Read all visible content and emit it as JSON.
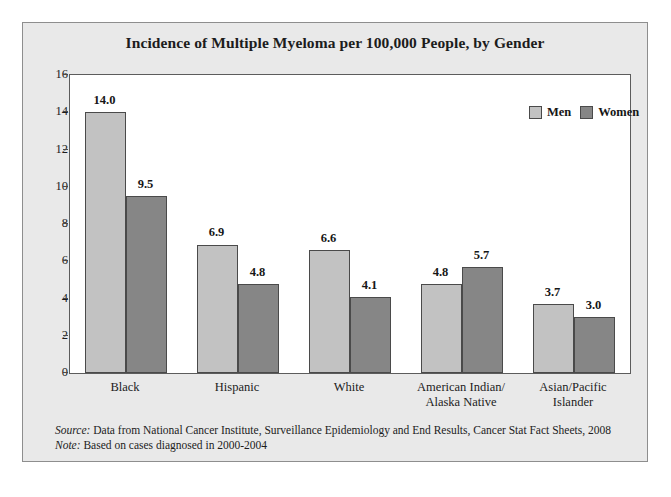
{
  "chart_data": {
    "type": "bar",
    "title": "Incidence of Multiple Myeloma per 100,000 People, by Gender",
    "xlabel": "",
    "ylabel": "",
    "ylim": [
      0,
      16
    ],
    "yticks": [
      0,
      2,
      4,
      6,
      8,
      10,
      12,
      14,
      16
    ],
    "ytick_labels": [
      "0",
      "2",
      "4",
      "6",
      "8",
      "10",
      "12",
      "14",
      "16"
    ],
    "grid": false,
    "legend_position": "top-right",
    "categories": [
      "Black",
      "Hispanic",
      "White",
      "American Indian/\nAlaska Native",
      "Asian/Pacific\nIslander"
    ],
    "series": [
      {
        "name": "Men",
        "color": "#c2c2c2",
        "values": [
          14.0,
          6.9,
          6.6,
          4.8,
          3.7
        ],
        "labels": [
          "14.0",
          "6.9",
          "6.6",
          "4.8",
          "3.7"
        ]
      },
      {
        "name": "Women",
        "color": "#868686",
        "values": [
          9.5,
          4.8,
          4.1,
          5.7,
          3.0
        ],
        "labels": [
          "9.5",
          "4.8",
          "4.1",
          "5.7",
          "3.0"
        ]
      }
    ],
    "annotations": [
      "Source: Data from National Cancer Institute, Surveillance Epidemiology and End Results, Cancer Stat Fact Sheets, 2008",
      "Note: Based on cases diagnosed in 2000-2004"
    ]
  },
  "legend": {
    "items": [
      {
        "label": "Men",
        "color": "#c2c2c2"
      },
      {
        "label": "Women",
        "color": "#868686"
      }
    ]
  },
  "footnotes": [
    {
      "key": "Source:",
      "text": " Data from National Cancer Institute, Surveillance Epidemiology and End Results, Cancer Stat Fact Sheets, 2008"
    },
    {
      "key": "Note:",
      "text": " Based on cases diagnosed in 2000-2004"
    }
  ],
  "colors": {
    "men_bar": "#c2c2c2",
    "women_bar": "#868686",
    "figure_background": "#e9e9e9",
    "plot_background": "#ffffff",
    "axis": "#5c5c5c",
    "text": "#1c1c1c"
  }
}
